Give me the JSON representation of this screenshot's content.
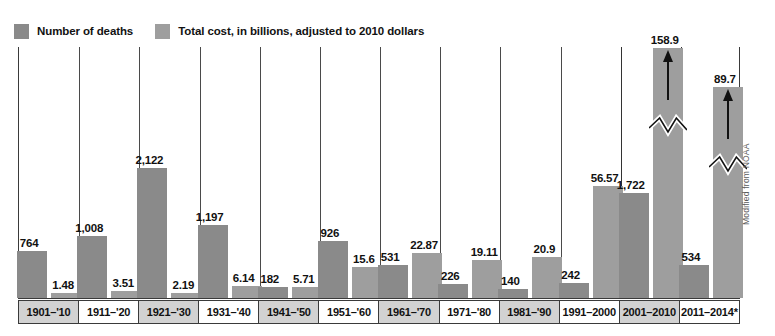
{
  "legend": {
    "entries": [
      {
        "label": "Number of deaths",
        "color": "#8a8a8a",
        "icon": "legend-swatch-icon"
      },
      {
        "label": "Total cost, in billions, adjusted to 2010 dollars",
        "color": "#9e9e9e",
        "icon": "legend-swatch-icon"
      }
    ]
  },
  "credit": {
    "text": "Modified from NOAA"
  },
  "chart_data": {
    "type": "bar",
    "title": "",
    "subtitle": "",
    "xlabel": "",
    "ylabel": "",
    "grid": false,
    "legend_position": "top-left",
    "categories": [
      "1901–'10",
      "1911–'20",
      "1921–'30",
      "1931–'40",
      "1941–'50",
      "1951–'60",
      "1961–'70",
      "1971–'80",
      "1981–'90",
      "1991–2000",
      "2001–2010",
      "2011–2014*"
    ],
    "series": [
      {
        "name": "Number of deaths",
        "color": "#8a8a8a",
        "values": [
          764,
          1008,
          2122,
          1197,
          182,
          926,
          531,
          226,
          140,
          242,
          1722,
          534
        ],
        "labels": [
          "764",
          "1,008",
          "2,122",
          "1,197",
          "182",
          "926",
          "531",
          "226",
          "140",
          "242",
          "1,722",
          "534"
        ]
      },
      {
        "name": "Total cost, in billions, adjusted to 2010 dollars",
        "color": "#9e9e9e",
        "values": [
          1.48,
          3.51,
          2.19,
          6.14,
          5.71,
          15.6,
          22.87,
          19.11,
          20.9,
          56.57,
          158.9,
          89.7
        ],
        "labels": [
          "1.48",
          "3.51",
          "2.19",
          "6.14",
          "5.71",
          "15.6",
          "22.87",
          "19.11",
          "20.9",
          "56.57",
          "158.9",
          "89.7"
        ],
        "truncated_indices": [
          10,
          11
        ]
      }
    ]
  }
}
